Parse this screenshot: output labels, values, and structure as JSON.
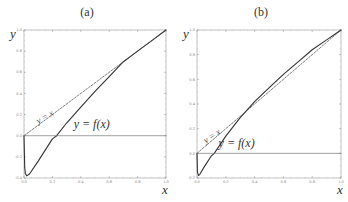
{
  "panels": [
    {
      "title": "(a)",
      "xlabel": "x",
      "ylabel": "y",
      "curve_label": "y = f(x)",
      "diag_label": "y = x"
    },
    {
      "title": "(b)",
      "xlabel": "x",
      "ylabel": "y",
      "curve_label": "y = f(x)",
      "diag_label": "y = x"
    }
  ],
  "chart_data": [
    {
      "type": "line",
      "title": "(a)",
      "xlabel": "x",
      "ylabel": "y",
      "xlim": [
        0,
        1
      ],
      "ylim": [
        -0.4,
        1.0
      ],
      "x_ticks": [
        "0.0",
        "0.2",
        "0.4",
        "0.6",
        "0.8",
        "1.0"
      ],
      "y_ticks": [
        "-0.4",
        "-0.2",
        "0.0",
        "0.2",
        "0.4",
        "0.6",
        "0.8",
        "1.0"
      ],
      "grid": false,
      "legend": "none",
      "annotations": [
        "y = x",
        "y = f(x)"
      ],
      "series": [
        {
          "name": "y = f(x)",
          "style": "solid",
          "x": [
            0.0,
            0.005,
            0.01,
            0.02,
            0.04,
            0.1,
            0.2,
            0.23,
            0.3,
            0.4,
            0.5,
            0.6,
            0.7,
            0.8,
            0.9,
            1.0
          ],
          "y": [
            0.0,
            -0.3,
            -0.36,
            -0.38,
            -0.36,
            -0.24,
            -0.03,
            0.0,
            0.12,
            0.27,
            0.42,
            0.56,
            0.7,
            0.8,
            0.9,
            1.0
          ]
        },
        {
          "name": "y = x",
          "style": "dashed",
          "x": [
            0,
            1
          ],
          "y": [
            0,
            1
          ]
        },
        {
          "name": "y = 0",
          "style": "solid-thin",
          "x": [
            0,
            1
          ],
          "y": [
            0,
            0
          ]
        }
      ]
    },
    {
      "type": "line",
      "title": "(b)",
      "xlabel": "x",
      "ylabel": "y",
      "xlim": [
        0,
        1
      ],
      "ylim": [
        -0.2,
        1.0
      ],
      "x_ticks": [
        "0.0",
        "0.2",
        "0.4",
        "0.6",
        "0.8",
        "1.0"
      ],
      "y_ticks": [
        "-0.2",
        "0.0",
        "0.2",
        "0.4",
        "0.6",
        "0.8",
        "1.0"
      ],
      "grid": false,
      "legend": "none",
      "annotations": [
        "y = x",
        "y = f(x)"
      ],
      "series": [
        {
          "name": "y = f(x)",
          "style": "solid",
          "x": [
            0.0,
            0.003,
            0.01,
            0.02,
            0.05,
            0.1,
            0.12,
            0.2,
            0.3,
            0.4,
            0.5,
            0.6,
            0.7,
            0.8,
            0.9,
            1.0
          ],
          "y": [
            0.0,
            -0.15,
            -0.18,
            -0.17,
            -0.11,
            -0.02,
            0.0,
            0.14,
            0.29,
            0.42,
            0.53,
            0.64,
            0.74,
            0.84,
            0.92,
            1.0
          ]
        },
        {
          "name": "y = x",
          "style": "dashed",
          "x": [
            0,
            1
          ],
          "y": [
            0,
            1
          ]
        },
        {
          "name": "y = 0",
          "style": "solid-thin",
          "x": [
            0,
            1
          ],
          "y": [
            0,
            0
          ]
        }
      ]
    }
  ]
}
